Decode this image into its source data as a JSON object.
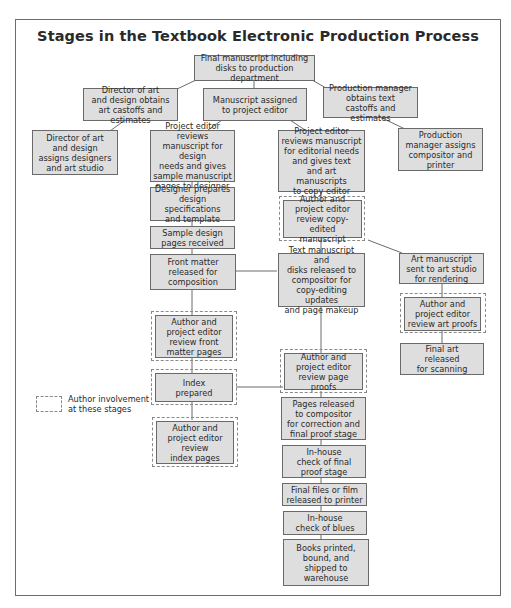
{
  "title": "Stages in the Textbook Electronic Production Process",
  "colors": {
    "box_fill": "#dedede",
    "box_border": "#6a6a6a",
    "dash": "#8a8a8a",
    "frame": "#6d6d6d"
  },
  "nodes": {
    "final_manuscript": "Final manuscript including\ndisks to production department",
    "director_obtains": "Director of art\nand design obtains\nart castoffs and estimates",
    "manuscript_assigned": "Manuscript assigned\nto project editor",
    "pm_obtains": "Production manager\nobtains text\ncastoffs and estimates",
    "director_assigns": "Director of art\nand design\nassigns designers\nand art studio",
    "pe_design": "Project editor reviews\nmanuscript for design\nneeds and gives\nsample manuscript\npages to designer",
    "pe_editorial": "Project editor\nreviews manuscript\nfor editorial needs\nand gives text\nand art manuscripts\nto copy editor",
    "pm_assigns": "Production\nmanager assigns\ncompositor and\nprinter",
    "designer_prepares": "Designer prepares\ndesign specifications\nand template",
    "author_copyedited": "Author and\nproject editor\nreview copy-edited\nmanuscript",
    "sample_pages": "Sample design\npages received",
    "front_matter_released": "Front matter\nreleased for\ncomposition",
    "text_released": "Text manuscript and\ndisks released to\ncompositor for\ncopy-editing updates\nand page makeup",
    "art_sent": "Art manuscript\nsent to art studio\nfor rendering",
    "author_art_proofs": "Author and\nproject editor\nreview art proofs",
    "author_front_matter": "Author and\nproject editor\nreview front\nmatter pages",
    "final_art": "Final art\nreleased\nfor scanning",
    "author_page_proofs": "Author and\nproject editor\nreview page proofs",
    "index_prepared": "Index\nprepared",
    "pages_released": "Pages released\nto compositor\nfor correction and\nfinal proof stage",
    "author_index": "Author and\nproject editor\nreview\nindex pages",
    "inhouse_final": "In-house\ncheck of final\nproof stage",
    "final_files": "Final files or film\nreleased to printer",
    "inhouse_blues": "In-house\ncheck of blues",
    "books_printed": "Books printed,\nbound, and\nshipped to\nwarehouse"
  },
  "legend": {
    "label": "Author involvement\nat these stages"
  }
}
